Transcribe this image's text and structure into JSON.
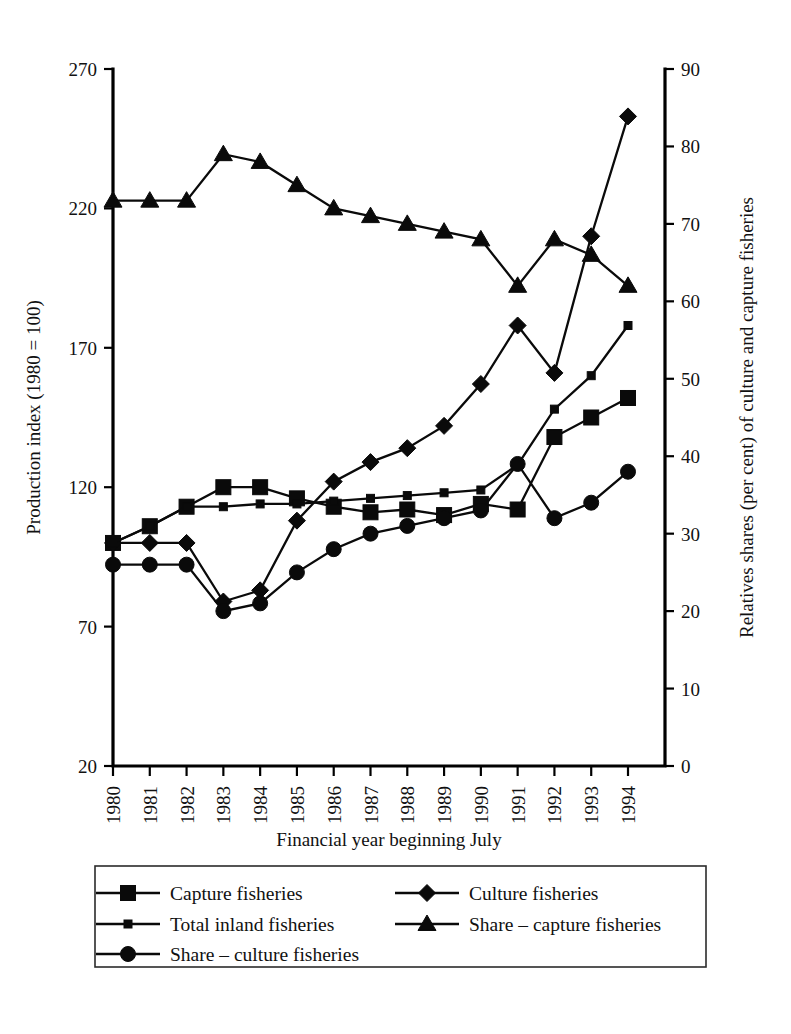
{
  "chart_data": {
    "type": "line",
    "title": "",
    "xlabel": "Financial year beginning July",
    "ylabel": "Production index (1980 = 100)",
    "y2label": "Relatives shares (per cent) of culture and capture fisheries",
    "x": [
      "1980",
      "1981",
      "1982",
      "1983",
      "1984",
      "1985",
      "1986",
      "1987",
      "1988",
      "1989",
      "1990",
      "1991",
      "1992",
      "1993",
      "1994"
    ],
    "categories": [
      "1980",
      "1981",
      "1982",
      "1983",
      "1984",
      "1985",
      "1986",
      "1987",
      "1988",
      "1989",
      "1990",
      "1991",
      "1992",
      "1993",
      "1994"
    ],
    "ylim": [
      20,
      270
    ],
    "yticks": [
      "20",
      "70",
      "120",
      "170",
      "220",
      "270"
    ],
    "y2lim": [
      0,
      90
    ],
    "y2ticks": [
      "0",
      "10",
      "20",
      "30",
      "40",
      "50",
      "60",
      "70",
      "80",
      "90"
    ],
    "grid": false,
    "legend_position": "bottom",
    "series": [
      {
        "name": "Capture fisheries",
        "marker": "square",
        "axis": "left",
        "values": [
          100,
          106,
          113,
          120,
          120,
          116,
          113,
          111,
          112,
          110,
          114,
          112,
          138,
          145,
          152
        ]
      },
      {
        "name": "Culture fisheries",
        "marker": "diamond",
        "axis": "left",
        "values": [
          100,
          100,
          100,
          79,
          83,
          108,
          122,
          129,
          134,
          142,
          157,
          178,
          161,
          210,
          253
        ]
      },
      {
        "name": "Total inland fisheries",
        "marker": "small-square",
        "axis": "left",
        "values": [
          100,
          106,
          113,
          113,
          114,
          114,
          115,
          116,
          117,
          118,
          119,
          128,
          148,
          160,
          178
        ]
      },
      {
        "name": "Share – capture fisheries",
        "marker": "triangle",
        "axis": "right",
        "values": [
          73,
          73,
          73,
          79,
          78,
          75,
          72,
          71,
          70,
          69,
          68,
          62,
          68,
          66,
          62
        ]
      },
      {
        "name": "Share – culture fisheries",
        "marker": "circle",
        "axis": "right",
        "values": [
          26,
          26,
          26,
          20,
          21,
          25,
          28,
          30,
          31,
          32,
          33,
          39,
          32,
          34,
          38
        ]
      }
    ]
  },
  "legend": {
    "items": [
      {
        "label": "Capture fisheries",
        "marker": "square"
      },
      {
        "label": "Culture fisheries",
        "marker": "diamond"
      },
      {
        "label": "Total inland fisheries",
        "marker": "small-square"
      },
      {
        "label": "Share – capture fisheries",
        "marker": "triangle"
      },
      {
        "label": "Share – culture fisheries",
        "marker": "circle"
      }
    ]
  }
}
